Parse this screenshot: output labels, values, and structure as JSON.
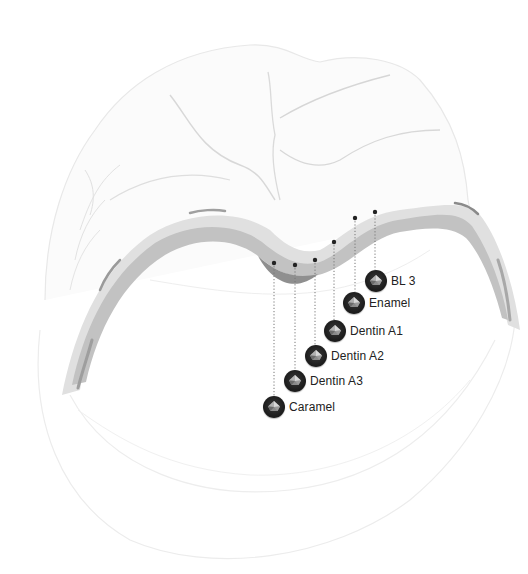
{
  "diagram": {
    "colors": {
      "outline": "#e6e6e6",
      "fissure": "#d4d4d4",
      "layer_outer": "#dcdcdc",
      "layer_inner": "#b8b8b8",
      "layer_core": "#8f8f8f",
      "leader_line": "#777777",
      "marker": "#222222",
      "label_text": "#222222"
    },
    "layers": [
      {
        "name": "BL 3",
        "dot": [
          375,
          212
        ],
        "badge": [
          376,
          281
        ]
      },
      {
        "name": "Enamel",
        "dot": [
          355,
          218
        ],
        "badge": [
          354,
          303
        ]
      },
      {
        "name": "Dentin A1",
        "dot": [
          334,
          242
        ],
        "badge": [
          335,
          331
        ]
      },
      {
        "name": "Dentin A2",
        "dot": [
          315,
          260
        ],
        "badge": [
          316,
          356
        ]
      },
      {
        "name": "Dentin A3",
        "dot": [
          295,
          265
        ],
        "badge": [
          295,
          381
        ]
      },
      {
        "name": "Caramel",
        "dot": [
          274,
          263
        ],
        "badge": [
          274,
          407
        ]
      }
    ]
  }
}
